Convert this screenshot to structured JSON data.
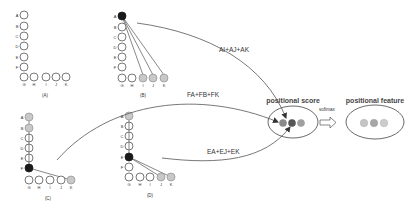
{
  "colors": {
    "empty": "#ffffff",
    "grey": "#c8c8c8",
    "black": "#1a1a1a",
    "stroke": "#555555",
    "score_dot_1": "#8a8a8a",
    "score_dot_2": "#555555",
    "score_dot_3": "#a0a0a0",
    "feature_dot_1": "#c4c4c4",
    "feature_dot_2": "#a6a6a6",
    "feature_dot_3": "#cccccc"
  },
  "panels": [
    {
      "id": "A",
      "caption": "(A)",
      "column_labels": [
        "A",
        "B",
        "C",
        "D",
        "E",
        "F"
      ],
      "row_labels": [
        "G",
        "H",
        "I",
        "J",
        "K"
      ],
      "column_states": [
        "empty",
        "empty",
        "empty",
        "empty",
        "empty",
        "empty"
      ],
      "row_states": [
        "empty",
        "empty",
        "empty",
        "empty",
        "empty"
      ]
    },
    {
      "id": "B",
      "caption": "(B)",
      "column_labels": [
        "A",
        "B",
        "C",
        "D",
        "E",
        "F"
      ],
      "row_labels": [
        "G",
        "H",
        "I",
        "J",
        "K"
      ],
      "column_states": [
        "black",
        "empty",
        "empty",
        "empty",
        "empty",
        "empty"
      ],
      "row_states": [
        "empty",
        "empty",
        "grey",
        "grey",
        "grey"
      ]
    },
    {
      "id": "C",
      "caption": "(C)",
      "column_labels": [
        "A",
        "B",
        "C",
        "D",
        "E",
        "F"
      ],
      "row_labels": [
        "G",
        "H",
        "I",
        "J",
        "K"
      ],
      "column_states": [
        "grey",
        "grey",
        "empty",
        "empty",
        "empty",
        "black"
      ],
      "row_states": [
        "empty",
        "empty",
        "empty",
        "empty",
        "grey"
      ]
    },
    {
      "id": "D",
      "caption": "(D)",
      "column_labels": [
        "A",
        "B",
        "C",
        "D",
        "E",
        "F"
      ],
      "row_labels": [
        "G",
        "H",
        "I",
        "J",
        "K"
      ],
      "column_states": [
        "grey",
        "empty",
        "empty",
        "empty",
        "black",
        "empty"
      ],
      "row_states": [
        "empty",
        "empty",
        "empty",
        "grey",
        "grey"
      ]
    }
  ],
  "edges": {
    "b_to_score": "AI+AJ+AK",
    "c_to_score": "FA+FB+FK",
    "d_to_score": "EA+EJ+EK"
  },
  "score": {
    "title": "positional score"
  },
  "softmax": {
    "label": "softmax"
  },
  "feature": {
    "title": "positional feature"
  }
}
